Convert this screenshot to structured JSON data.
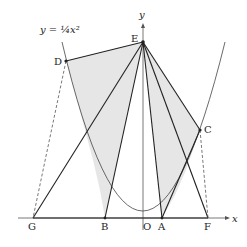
{
  "diagram": {
    "curve_label": "y = ¼x²",
    "axis_x": "x",
    "axis_y": "y",
    "points": {
      "D": "D",
      "E": "E",
      "C": "C",
      "G": "G",
      "B": "B",
      "O": "O",
      "A": "A",
      "F": "F"
    },
    "colors": {
      "shade": "#e6e6e6",
      "line": "#222222",
      "axis": "#555555"
    }
  }
}
